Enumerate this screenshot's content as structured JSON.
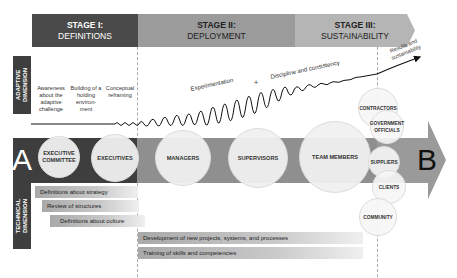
{
  "stages": [
    {
      "number": "STAGE I:",
      "name": "DEFINITIONS",
      "color": "#4a4a4a"
    },
    {
      "number": "STAGE II:",
      "name": "DEPLOYMENT",
      "color": "#9b9b9b"
    },
    {
      "number": "STAGE III:",
      "name": "SUSTAINABILITY",
      "color": "#b5b5b5"
    }
  ],
  "dimensions": {
    "adaptive": "ADAPTIVE DIMENSION",
    "technical": "TECHNICAL DIMENSION"
  },
  "adaptive_steps": [
    "Awareness about the adaptive challenge",
    "Building of a holding environ-ment",
    "Conceptual reframing"
  ],
  "wave_labels": {
    "experimentation": "Experimentation",
    "plus": "+",
    "discipline": "Discipline and consistency",
    "results": "Results and sustainability"
  },
  "main_arrow": {
    "start": "A",
    "end": "B",
    "circles": [
      "EXECUTIVE COMMITTEE",
      "EXECUTIVES",
      "MANAGERS",
      "SUPERVISORS",
      "TEAM MEMBERS"
    ]
  },
  "stakeholders": [
    "CONTRACTORS",
    "GOVERNMENT OFFICIALS",
    "SUPPLIERS",
    "CLIENTS",
    "COMMUNITY"
  ],
  "technical_items": {
    "stage1": [
      "Definitions about strategy",
      "Review of structures",
      "Definitions about culture"
    ],
    "stage2": [
      "Development of new projects, systems, and processes",
      "Training of skills and competencies"
    ]
  },
  "colors": {
    "dark": "#3e3e3e",
    "mid": "#8f8f8f",
    "light": "#b5b5b5"
  }
}
